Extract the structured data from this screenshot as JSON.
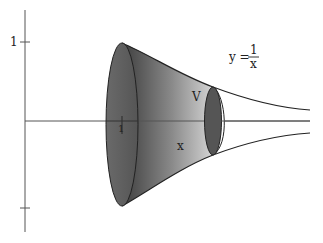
{
  "figure": {
    "type": "solid-of-revolution",
    "curve_label": {
      "lhs": "y =",
      "numerator": "1",
      "denominator": "x"
    },
    "y_tick_label": "1",
    "x_tick_label": "1",
    "volume_label": "V",
    "cross_section_label": "x",
    "colors": {
      "axis": "#555555",
      "curve": "#222222",
      "left_disk": "#5e5e5e",
      "solid_dark": "#4a4a4a",
      "solid_light": "#d6d6d6",
      "small_disk": "#555555",
      "background": "#ffffff"
    }
  }
}
